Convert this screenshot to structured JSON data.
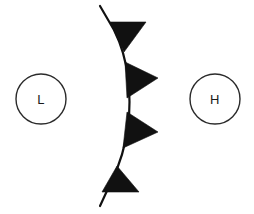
{
  "figure": {
    "background_color": "#ffffff",
    "ink_color": "#111111",
    "width": 254,
    "height": 214
  },
  "pressure_centers": [
    {
      "id": "low",
      "label": "L",
      "name": "low-pressure-center",
      "cx": 41,
      "cy": 99,
      "r": 25,
      "stroke_color": "#2b2b2b"
    },
    {
      "id": "high",
      "label": "H",
      "name": "high-pressure-center",
      "cx": 215,
      "cy": 99,
      "r": 25,
      "stroke_color": "#2b2b2b"
    }
  ],
  "front": {
    "type": "cold-front",
    "name": "cold-front-line",
    "color": "#111111",
    "stroke_width": 2.2,
    "path": "M 100 6 L 114 30 Q 125 52 128 78 Q 131 102 128 126 Q 124 156 112 180 L 100 206",
    "barb_count": 4,
    "barbs": [
      {
        "index": 1,
        "name": "front-barb-1",
        "points": "110 22 146 22 124 52"
      },
      {
        "index": 2,
        "name": "front-barb-2",
        "points": "125 62 158 78 127 98"
      },
      {
        "index": 3,
        "name": "front-barb-3",
        "points": "127 112 158 132 123 148"
      },
      {
        "index": 4,
        "name": "front-barb-4",
        "points": "117 166 139 192 102 192"
      }
    ]
  }
}
